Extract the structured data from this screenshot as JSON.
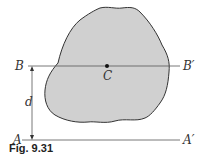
{
  "figure": {
    "caption": "Fig. 9.31",
    "labels": {
      "B": "B",
      "B_prime": "B′",
      "A": "A",
      "A_prime": "A′",
      "C": "C",
      "d": "d"
    },
    "colors": {
      "fill": "#d0d0d0",
      "stroke": "#333333",
      "line": "#555555"
    }
  }
}
